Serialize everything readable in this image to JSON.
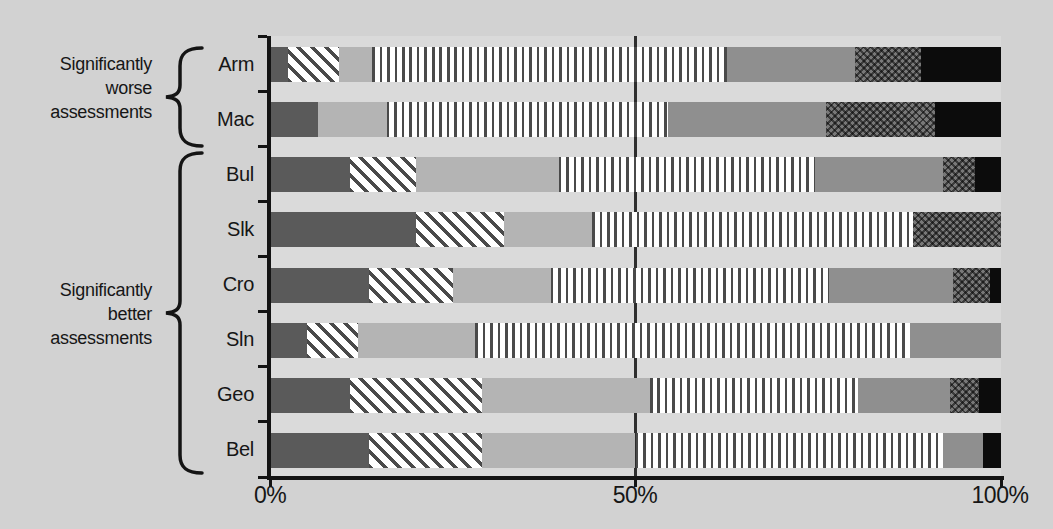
{
  "annotations": {
    "groups": [
      {
        "lines": [
          "Significantly",
          "worse",
          "assessments"
        ],
        "span": [
          "Arm",
          "Mac"
        ]
      },
      {
        "lines": [
          "Significantly",
          "better",
          "assessments"
        ],
        "span": [
          "Bul",
          "Slk",
          "Cro",
          "Sln",
          "Geo",
          "Bel"
        ]
      }
    ]
  },
  "colors": {
    "page_background": "#d2d2d2",
    "plot_background": "#dadada",
    "dark_gray_segment": "#5a5a5a",
    "light_gray_segment": "#b4b4b4",
    "medium_gray_segment": "#8f8f8f",
    "black_segment": "#0c0c0c",
    "hatch_line": "#4a4a4a",
    "axis": "#141414"
  },
  "chart_data": {
    "type": "bar",
    "orientation": "horizontal",
    "stacked": true,
    "unit": "percent",
    "grid": "single vertical gridline at 50%",
    "legend": "none",
    "categories": [
      "Arm",
      "Mac",
      "Bul",
      "Slk",
      "Cro",
      "Sln",
      "Geo",
      "Bel"
    ],
    "series": [
      {
        "name": "segment-1-dark-gray",
        "pattern": "solid-dark-gray",
        "values": [
          2.5,
          6.5,
          11,
          20,
          13.5,
          5,
          11,
          13.5
        ]
      },
      {
        "name": "segment-2-diagonal-hatch",
        "pattern": "diagonal-hatch",
        "values": [
          7,
          0,
          9,
          12,
          11.5,
          7,
          18,
          15.5
        ]
      },
      {
        "name": "segment-3-light-gray",
        "pattern": "solid-light-gray",
        "values": [
          4.5,
          9.5,
          19.5,
          12,
          13.5,
          16,
          23,
          21
        ]
      },
      {
        "name": "segment-4-vertical-stripe",
        "pattern": "vertical-stripes",
        "values": [
          48.5,
          38.5,
          35,
          44,
          38,
          59.5,
          28.5,
          42
        ]
      },
      {
        "name": "segment-5-medium-gray",
        "pattern": "solid-medium-gray",
        "values": [
          17.5,
          21.5,
          17.5,
          0,
          17,
          12.5,
          12.5,
          5.5
        ]
      },
      {
        "name": "segment-6-crosshatch",
        "pattern": "crosshatch-dark",
        "values": [
          9,
          15,
          4.5,
          12,
          5,
          0,
          4,
          0
        ]
      },
      {
        "name": "segment-7-black",
        "pattern": "solid-black",
        "values": [
          11,
          9,
          3.5,
          0,
          1.5,
          0,
          3,
          2.5
        ]
      }
    ],
    "x_axis": {
      "min": 0,
      "max": 100,
      "tick_labels": [
        "0%",
        "50%",
        "100%"
      ],
      "gridline_at": 50
    }
  }
}
